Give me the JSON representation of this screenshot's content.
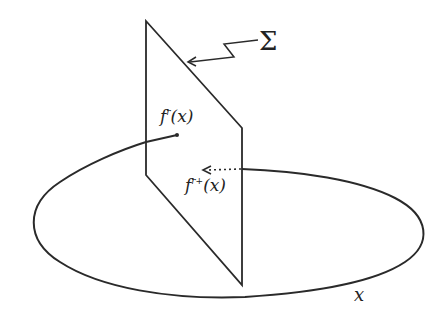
{
  "diagram": {
    "labels": {
      "sigma": "Σ",
      "f_r": {
        "base": "f",
        "sup": "r",
        "arg": "(x)"
      },
      "f_r_plus": {
        "base": "f",
        "sup": "r+",
        "arg": "(x)"
      },
      "x": "x"
    },
    "colors": {
      "stroke": "#2a2a2a",
      "background": "#ffffff"
    },
    "elements": [
      "plane Σ (parallelogram, vertical)",
      "ellipse (closed curve) through the plane",
      "zigzag pointer from Σ label to plane",
      "solid curve ending at point f^r(x) on front of plane",
      "dotted arrow pointing to f^{r+}(x) behind the plane",
      "label x at bottom right of ellipse"
    ]
  }
}
